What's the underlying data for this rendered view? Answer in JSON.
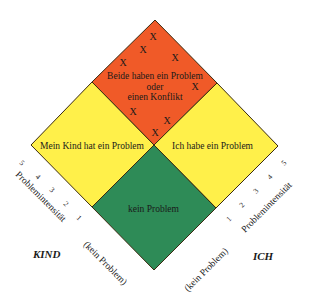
{
  "diagram": {
    "regions": {
      "top": {
        "label_line1": "Beide haben ein Problem",
        "label_line2": "oder",
        "label_line3": "einen Konflikt",
        "color": "#F05A28"
      },
      "left": {
        "label": "Mein Kind hat ein Problem",
        "color": "#FFF04A"
      },
      "right": {
        "label": "Ich habe ein Problem",
        "color": "#FFF04A"
      },
      "bottom": {
        "label": "kein Problem",
        "color": "#2E8B57"
      }
    },
    "conflict_marks": [
      "X",
      "X",
      "X",
      "X",
      "X",
      "X",
      "X",
      "X"
    ],
    "axes": {
      "left": {
        "title": "Problemintensität",
        "zero_label": "(kein Problem)",
        "ticks": [
          "5",
          "4",
          "3",
          "2",
          "1"
        ],
        "party": "KIND"
      },
      "right": {
        "title": "Problemintensität",
        "zero_label": "(kein Problem)",
        "ticks": [
          "1",
          "2",
          "3",
          "4",
          "5"
        ],
        "party": "ICH"
      }
    },
    "outline_color": "#3a2a10"
  }
}
